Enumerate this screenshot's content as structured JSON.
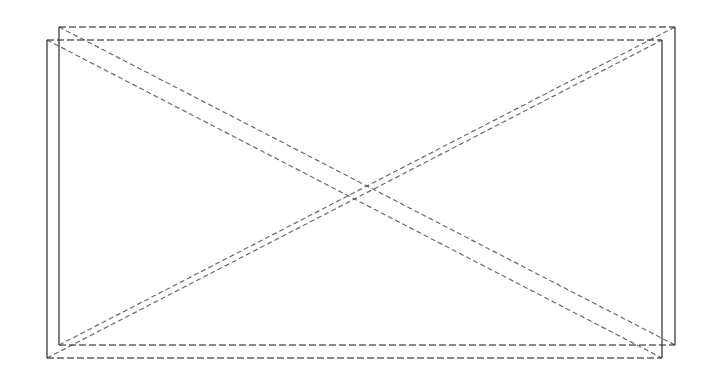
{
  "diagram": {
    "background": "#ffffff",
    "stroke_color": "#3a3a3a",
    "shapes": [
      {
        "name": "rectangle-a",
        "x1": 59,
        "y1": 27,
        "x2": 675,
        "y2": 345,
        "diagonals": true
      },
      {
        "name": "rectangle-b",
        "x1": 47,
        "y1": 40,
        "x2": 662,
        "y2": 358,
        "diagonals": true
      }
    ]
  }
}
